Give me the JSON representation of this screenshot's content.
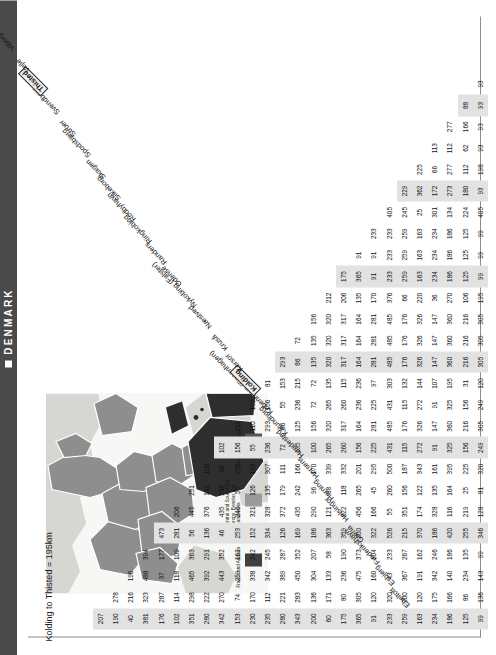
{
  "header": {
    "title": "DENMARK",
    "square_icon": "white-square-icon"
  },
  "map": {
    "legend": [
      {
        "label": "France and Andorra",
        "color": "#3f3f3f"
      },
      {
        "label": "Central and South East Europe, Benelux and Scandinavia",
        "color": "#9a9a9a"
      },
      {
        "label": "Spain and Portugal",
        "color": "#555555"
      }
    ],
    "sea_color": "#f7f7f5",
    "land_light": "#d6d6d2",
    "land_mid": "#8e8e8e",
    "land_dark": "#2e2e2e"
  },
  "matrix": {
    "annotation": "Kolding to Thisted = 195km",
    "highlight_city": "Kolding",
    "highlight_city_2": "Thisted",
    "highlight_value": "195",
    "cities": [
      "Ebeltoft",
      "Esbjerg",
      "Frederikshavn",
      "Grena",
      "Helsingor",
      "Herning",
      "Horsens",
      "Hundested",
      "Kalundborg",
      "Kobenhavn (Copenhagen)",
      "Kolding",
      "Korsor",
      "Kruså",
      "Næstved",
      "Nykobing (Falster)",
      "Odense",
      "Randers",
      "Ringkobing",
      "Rodbyhavn",
      "Silkeborg",
      "Skagen",
      "Spodsbjerg",
      "Struer",
      "Svendborg",
      "Thisted",
      "Vejle",
      "Viborg"
    ],
    "rows": [
      [
        "207"
      ],
      [
        "190",
        "278"
      ],
      [
        "40",
        "216",
        "196"
      ],
      [
        "381",
        "323",
        "488",
        "394"
      ],
      [
        "176",
        "287",
        "37",
        "177",
        "473"
      ],
      [
        "102",
        "114",
        "118",
        "109",
        "281",
        "206"
      ],
      [
        "351",
        "298",
        "465",
        "363",
        "56",
        "445",
        "251"
      ],
      [
        "280",
        "222",
        "392",
        "291",
        "136",
        "376",
        "182",
        "108"
      ],
      [
        "342",
        "270",
        "443",
        "352",
        "46",
        "435",
        "238",
        "66",
        "102"
      ],
      [
        "153",
        "74",
        "259",
        "162",
        "253",
        "246",
        "55",
        "225",
        "156",
        "211"
      ],
      [
        "230",
        "170",
        "338",
        "242",
        "152",
        "321",
        "126",
        "123",
        "55",
        "110",
        "102"
      ],
      [
        "235",
        "112",
        "342",
        "245",
        "334",
        "328",
        "135",
        "307",
        "236",
        "293",
        "156",
        "81"
      ],
      [
        "280",
        "221",
        "389",
        "287",
        "126",
        "372",
        "179",
        "111",
        "72",
        "86",
        "55",
        "153",
        "293"
      ],
      [
        "343",
        "283",
        "450",
        "352",
        "169",
        "435",
        "242",
        "166",
        "135",
        "125",
        "236",
        "215",
        "86",
        "72"
      ],
      [
        "200",
        "136",
        "304",
        "207",
        "186",
        "290",
        "96",
        "170",
        "100",
        "156",
        "72",
        "72",
        "135",
        "135",
        "156"
      ],
      [
        "60",
        "171",
        "133",
        "58",
        "363",
        "121",
        "88",
        "339",
        "265",
        "320",
        "265",
        "135",
        "320",
        "320",
        "320",
        "212"
      ],
      [
        "175",
        "80",
        "236",
        "190",
        "359",
        "222",
        "118",
        "332",
        "260",
        "317",
        "260",
        "115",
        "317",
        "317",
        "317",
        "206",
        "175"
      ],
      [
        "365",
        "305",
        "475",
        "373",
        "200",
        "456",
        "265",
        "201",
        "156",
        "164",
        "236",
        "236",
        "164",
        "164",
        "164",
        "135",
        "365",
        "91"
      ],
      [
        "91",
        "120",
        "160",
        "104",
        "322",
        "166",
        "45",
        "295",
        "225",
        "281",
        "225",
        "97",
        "281",
        "281",
        "281",
        "170",
        "91",
        "91",
        "233"
      ],
      [
        "233",
        "320",
        "43",
        "233",
        "526",
        "55",
        "260",
        "500",
        "431",
        "485",
        "431",
        "303",
        "485",
        "485",
        "485",
        "376",
        "233",
        "233",
        "233",
        "405"
      ],
      [
        "259",
        "200",
        "367",
        "267",
        "215",
        "351",
        "156",
        "187",
        "115",
        "176",
        "115",
        "132",
        "176",
        "176",
        "176",
        "66",
        "259",
        "259",
        "259",
        "245",
        "229"
      ],
      [
        "163",
        "120",
        "191",
        "162",
        "370",
        "174",
        "122",
        "343",
        "272",
        "326",
        "272",
        "144",
        "326",
        "326",
        "326",
        "220",
        "163",
        "163",
        "163",
        "25",
        "362",
        "225"
      ],
      [
        "234",
        "175",
        "342",
        "246",
        "186",
        "328",
        "135",
        "161",
        "91",
        "147",
        "91",
        "107",
        "147",
        "147",
        "147",
        "36",
        "234",
        "234",
        "234",
        "301",
        "172",
        "66",
        "113"
      ],
      [
        "186",
        "166",
        "140",
        "186",
        "420",
        "116",
        "164",
        "395",
        "325",
        "360",
        "325",
        "195",
        "360",
        "360",
        "360",
        "270",
        "186",
        "186",
        "186",
        "134",
        "273",
        "277",
        "112",
        "277"
      ],
      [
        "125",
        "86",
        "234",
        "135",
        "255",
        "219",
        "25",
        "225",
        "156",
        "216",
        "156",
        "31",
        "216",
        "216",
        "216",
        "106",
        "125",
        "125",
        "125",
        "224",
        "180",
        "112",
        "62",
        "166",
        "88"
      ],
      [
        "99",
        "136",
        "143",
        "99",
        "346",
        "128",
        "81",
        "320",
        "249",
        "305",
        "249",
        "120",
        "305",
        "305",
        "305",
        "195",
        "99",
        "99",
        "99",
        "405",
        "93",
        "198",
        "93",
        "93",
        "93",
        "93"
      ]
    ],
    "top_labels_right": [
      "Skagen",
      "Spodsbjerg",
      "Struer",
      "Svendborg",
      "Thisted",
      "Vejle",
      "Viborg"
    ],
    "shade_columns": [
      0,
      4,
      8,
      12,
      16,
      20,
      24
    ]
  }
}
